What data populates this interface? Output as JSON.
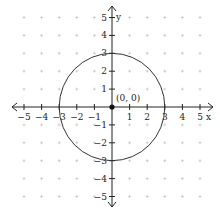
{
  "chart_data": {
    "type": "scatter",
    "title": "",
    "xlabel": "x",
    "ylabel": "y",
    "xlim": [
      -5,
      5
    ],
    "ylim": [
      -5,
      5
    ],
    "grid": "dots",
    "x_ticks": [
      -5,
      -4,
      -3,
      -2,
      -1,
      1,
      2,
      3,
      4,
      5
    ],
    "y_ticks": [
      -5,
      -4,
      -3,
      -2,
      -1,
      1,
      2,
      3,
      4,
      5
    ],
    "x_tick_labels": [
      "−5",
      "−4",
      "−3",
      "−2",
      "−1",
      "1",
      "2",
      "3",
      "4",
      "5"
    ],
    "y_tick_labels": [
      "−5",
      "−4",
      "−3",
      "−2",
      "−1",
      "1",
      "2",
      "3",
      "4",
      "5"
    ],
    "shapes": [
      {
        "kind": "circle",
        "center": [
          0,
          0
        ],
        "radius": 3
      }
    ],
    "points": [
      {
        "x": 0,
        "y": 0,
        "label": "(0, 0)"
      }
    ]
  },
  "colors": {
    "axis": "#222222",
    "curve": "#333333",
    "grid": "#c8c8c8"
  }
}
